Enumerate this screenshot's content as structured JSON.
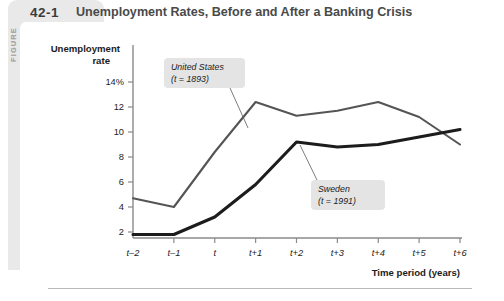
{
  "figure": {
    "label": "FIGURE",
    "number": "42-1",
    "title": "Unemployment Rates, Before and After a Banking Crisis"
  },
  "chart_data": {
    "type": "line",
    "title": "Unemployment Rates, Before and After a Banking Crisis",
    "xlabel": "Time period (years)",
    "ylabel": "Unemployment rate",
    "ylabel_line1": "Unemployment",
    "ylabel_line2": "rate",
    "categories": [
      "t–2",
      "t–1",
      "t",
      "t+1",
      "t+2",
      "t+3",
      "t+4",
      "t+5",
      "t+6"
    ],
    "x_tick_labels": [
      "t–2",
      "t–1",
      "t",
      "t+1",
      "t+2",
      "t+3",
      "t+4",
      "t+5",
      "t+6"
    ],
    "y_tick_labels": [
      "14%",
      "12",
      "10",
      "8",
      "6",
      "4",
      "2"
    ],
    "y_tick_values": [
      14,
      12,
      10,
      8,
      6,
      4,
      2
    ],
    "ylim": [
      0,
      15
    ],
    "grid": false,
    "legend": "annotations",
    "series": [
      {
        "name": "United States",
        "annotation": "United States\n(t = 1893)",
        "annotation_line1": "United States",
        "annotation_line2": "(t = 1893)",
        "color": "#555555",
        "width": 2.1,
        "values": [
          4.7,
          4.0,
          8.4,
          12.4,
          11.3,
          11.7,
          12.4,
          11.2,
          9.0
        ]
      },
      {
        "name": "Sweden",
        "annotation": "Sweden\n(t = 1991)",
        "annotation_line1": "Sweden",
        "annotation_line2": "(t = 1991)",
        "color": "#1c1c1c",
        "width": 3.1,
        "values": [
          1.8,
          1.8,
          3.2,
          5.8,
          9.2,
          8.8,
          9.0,
          9.6,
          10.2
        ]
      }
    ]
  },
  "colors": {
    "panel": "#e9e9e9",
    "annotation_box": "#e4e4e4",
    "axis": "#8a8a8a",
    "text": "#1c1c1c"
  }
}
